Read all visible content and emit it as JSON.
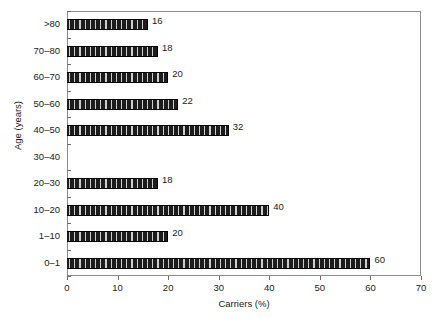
{
  "chart_data": {
    "type": "bar",
    "orientation": "horizontal",
    "title": "",
    "xlabel": "Carriers (%)",
    "ylabel": "Age (years)",
    "xlim": [
      0,
      70
    ],
    "ylim_categories": 10,
    "xticks": [
      0,
      10,
      20,
      30,
      40,
      50,
      60,
      70
    ],
    "xtick_labels": [
      "0",
      "10",
      "20",
      "30",
      "40",
      "50",
      "60",
      "70"
    ],
    "grid": false,
    "legend": null,
    "bar_fill": "#1c1c1c",
    "bar_hatch": "vertical-light-stripes",
    "categories": [
      "0–1",
      "1–10",
      "10–20",
      "20–30",
      "30–40",
      "40–50",
      "50–60",
      "60–70",
      "70–80",
      ">80"
    ],
    "values": [
      60,
      20,
      40,
      18,
      0,
      32,
      22,
      20,
      18,
      16
    ],
    "data_labels": [
      "60",
      "20",
      "40",
      "18",
      "",
      "32",
      "22",
      "20",
      "18",
      "16"
    ],
    "rows_top_to_bottom": [
      {
        "category": ">80",
        "value": 16,
        "label": "16"
      },
      {
        "category": "70–80",
        "value": 18,
        "label": "18"
      },
      {
        "category": "60–70",
        "value": 20,
        "label": "20"
      },
      {
        "category": "50–60",
        "value": 22,
        "label": "22"
      },
      {
        "category": "40–50",
        "value": 32,
        "label": "32"
      },
      {
        "category": "30–40",
        "value": 0,
        "label": ""
      },
      {
        "category": "20–30",
        "value": 18,
        "label": "18"
      },
      {
        "category": "10–20",
        "value": 40,
        "label": "40"
      },
      {
        "category": "1–10",
        "value": 20,
        "label": "20"
      },
      {
        "category": "0–1",
        "value": 60,
        "label": "60"
      }
    ]
  }
}
